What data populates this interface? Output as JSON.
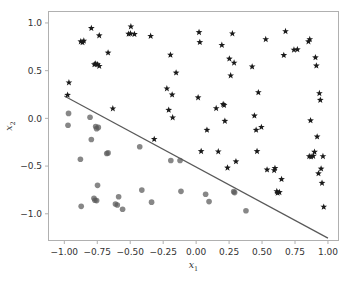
{
  "chart_data": {
    "type": "scatter",
    "title": "",
    "xlabel": "x_1",
    "ylabel": "x_2",
    "xlim": [
      -1.12,
      1.08
    ],
    "ylim": [
      -1.28,
      1.12
    ],
    "grid": false,
    "legend": "none",
    "xticks": [
      -1.0,
      -0.75,
      -0.5,
      -0.25,
      0.0,
      0.25,
      0.5,
      0.75,
      1.0
    ],
    "xticklabels": [
      "−1.00",
      "−0.75",
      "−0.50",
      "−0.25",
      "0.00",
      "0.25",
      "0.50",
      "0.75",
      "1.00"
    ],
    "yticks": [
      -1.0,
      -0.5,
      0.0,
      0.5,
      1.0
    ],
    "yticklabels": [
      "−1.0",
      "−0.5",
      "0.0",
      "0.5",
      "1.0"
    ],
    "series": [
      {
        "name": "class-positive",
        "marker": "star",
        "color": "#1a1a1a",
        "size": 26,
        "points": [
          [
            -0.875,
            0.805
          ],
          [
            -0.862,
            0.795
          ],
          [
            -0.852,
            0.812
          ],
          [
            -0.795,
            0.945
          ],
          [
            -0.735,
            0.868
          ],
          [
            -0.965,
            0.375
          ],
          [
            -0.975,
            0.245
          ],
          [
            -0.772,
            0.565
          ],
          [
            -0.762,
            0.572
          ],
          [
            -0.748,
            0.565
          ],
          [
            -0.735,
            0.548
          ],
          [
            -0.668,
            0.688
          ],
          [
            -0.632,
            0.102
          ],
          [
            -0.495,
            0.962
          ],
          [
            -0.512,
            0.885
          ],
          [
            -0.498,
            0.888
          ],
          [
            -0.468,
            0.882
          ],
          [
            -0.345,
            0.862
          ],
          [
            -0.318,
            -0.218
          ],
          [
            -0.222,
            0.312
          ],
          [
            -0.208,
            0.088
          ],
          [
            -0.182,
            0.248
          ],
          [
            -0.178,
            0.008
          ],
          [
            -0.195,
            0.665
          ],
          [
            -0.152,
            0.478
          ],
          [
            0.022,
            0.902
          ],
          [
            0.028,
            0.798
          ],
          [
            0.015,
            0.218
          ],
          [
            0.038,
            -0.345
          ],
          [
            0.082,
            -0.122
          ],
          [
            0.152,
            0.105
          ],
          [
            0.168,
            -0.348
          ],
          [
            0.195,
            0.768
          ],
          [
            0.205,
            0.148
          ],
          [
            0.212,
            0.138
          ],
          [
            0.218,
            -0.028
          ],
          [
            0.238,
            -0.518
          ],
          [
            0.252,
            0.625
          ],
          [
            0.262,
            0.448
          ],
          [
            0.275,
            0.888
          ],
          [
            0.288,
            0.582
          ],
          [
            0.302,
            -0.452
          ],
          [
            0.425,
            0.542
          ],
          [
            0.442,
            0.028
          ],
          [
            0.455,
            -0.122
          ],
          [
            0.462,
            -0.345
          ],
          [
            0.472,
            0.272
          ],
          [
            0.495,
            -0.092
          ],
          [
            0.528,
            0.828
          ],
          [
            0.538,
            -0.538
          ],
          [
            0.592,
            -0.545
          ],
          [
            0.598,
            -0.522
          ],
          [
            0.612,
            -0.765
          ],
          [
            0.618,
            -0.782
          ],
          [
            0.632,
            -0.775
          ],
          [
            0.648,
            -0.638
          ],
          [
            0.665,
            0.662
          ],
          [
            0.678,
            0.912
          ],
          [
            0.742,
            0.718
          ],
          [
            0.768,
            0.722
          ],
          [
            0.852,
            0.805
          ],
          [
            0.862,
            0.828
          ],
          [
            0.868,
            -0.022
          ],
          [
            0.858,
            -0.398
          ],
          [
            0.872,
            -0.402
          ],
          [
            0.888,
            -0.395
          ],
          [
            0.898,
            -0.352
          ],
          [
            0.905,
            0.638
          ],
          [
            0.912,
            0.552
          ],
          [
            0.918,
            -0.192
          ],
          [
            0.928,
            -0.578
          ],
          [
            0.935,
            0.262
          ],
          [
            0.942,
            0.192
          ],
          [
            0.948,
            -0.528
          ],
          [
            0.955,
            -0.678
          ],
          [
            0.962,
            -0.398
          ],
          [
            0.968,
            -0.928
          ]
        ]
      },
      {
        "name": "class-negative",
        "marker": "circle",
        "color": "#595959",
        "size": 30,
        "opacity": 0.72,
        "points": [
          [
            -0.968,
            0.052
          ],
          [
            -0.972,
            -0.072
          ],
          [
            -0.878,
            -0.428
          ],
          [
            -0.872,
            -0.922
          ],
          [
            -0.805,
            0.012
          ],
          [
            -0.795,
            -0.222
          ],
          [
            -0.762,
            -0.085
          ],
          [
            -0.755,
            -0.108
          ],
          [
            -0.742,
            -0.095
          ],
          [
            -0.748,
            -0.702
          ],
          [
            -0.775,
            -0.838
          ],
          [
            -0.768,
            -0.858
          ],
          [
            -0.755,
            -0.862
          ],
          [
            -0.678,
            -0.368
          ],
          [
            -0.668,
            -0.362
          ],
          [
            -0.612,
            -0.898
          ],
          [
            -0.598,
            -0.908
          ],
          [
            -0.588,
            -0.822
          ],
          [
            -0.558,
            -0.952
          ],
          [
            -0.428,
            -0.298
          ],
          [
            -0.412,
            -0.752
          ],
          [
            -0.338,
            -0.878
          ],
          [
            -0.192,
            -0.442
          ],
          [
            -0.122,
            -0.442
          ],
          [
            -0.115,
            -0.765
          ],
          [
            0.072,
            -0.795
          ],
          [
            0.098,
            -0.872
          ],
          [
            0.285,
            -0.768
          ],
          [
            0.292,
            -0.778
          ],
          [
            0.378,
            -0.968
          ]
        ]
      }
    ],
    "decision_boundary": {
      "name": "decision-boundary",
      "color": "#595959",
      "width": 1.2,
      "x0": -1.0,
      "y0": 0.235,
      "x1": 1.0,
      "y1": -1.255
    }
  }
}
